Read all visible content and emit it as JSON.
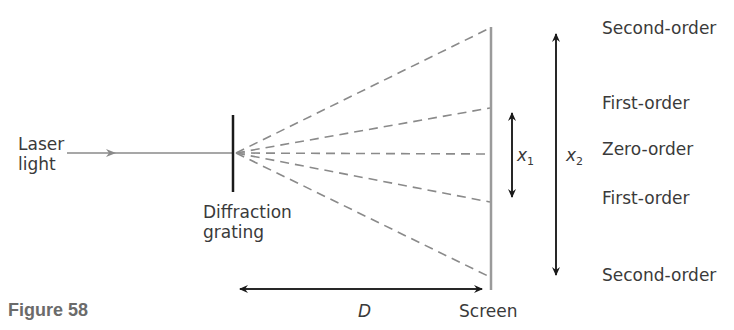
{
  "figure": {
    "caption": "Figure 58",
    "labels": {
      "laser_line1": "Laser",
      "laser_line2": "light",
      "grating_line1": "Diffraction",
      "grating_line2": "grating",
      "screen": "Screen",
      "distance": "D",
      "x1": "x",
      "x1_sub": "1",
      "x2": "x",
      "x2_sub": "2"
    },
    "orders": [
      {
        "label": "Second-order"
      },
      {
        "label": "First-order"
      },
      {
        "label": "Zero-order"
      },
      {
        "label": "First-order"
      },
      {
        "label": "Second-order"
      }
    ],
    "colors": {
      "ray": "#8a8a8a",
      "arrow": "#1a1a1a",
      "screen": "#9a9a9a",
      "caption": "#6b6b6b"
    }
  }
}
